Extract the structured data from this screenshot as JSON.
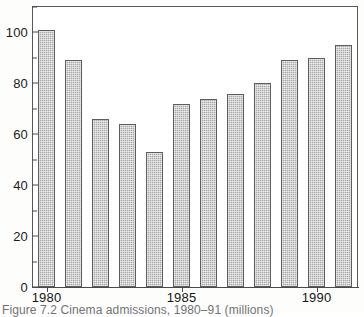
{
  "figure": {
    "caption": "Figure 7.2  Cinema admissions, 1980–91 (millions)"
  },
  "chart_data": {
    "type": "bar",
    "title": "",
    "subtitle": "",
    "xlabel": "",
    "ylabel": "",
    "categories": [
      "1980",
      "1981",
      "1982",
      "1983",
      "1984",
      "1985",
      "1986",
      "1987",
      "1988",
      "1989",
      "1990",
      "1991"
    ],
    "values": [
      101,
      89,
      66,
      64,
      53,
      72,
      74,
      76,
      80,
      89,
      90,
      95
    ],
    "x_tick_labels": [
      "1980",
      "1985",
      "1990"
    ],
    "x_tick_categories": [
      "1980",
      "1985",
      "1990"
    ],
    "y_tick_labels": [
      "0",
      "20",
      "40",
      "60",
      "80",
      "100"
    ],
    "y_major_ticks": [
      0,
      20,
      40,
      60,
      80,
      100
    ],
    "y_minor_ticks": [
      10,
      30,
      50,
      70,
      90,
      110
    ],
    "ylim": [
      0,
      110
    ],
    "grid": false,
    "legend": null,
    "legend_position": "none",
    "bar_fill_color": "#a9a9a9",
    "bar_edge_color": "#5d5d5f",
    "axis_color": "#4a4a4c",
    "background_color": "#ffffff"
  }
}
